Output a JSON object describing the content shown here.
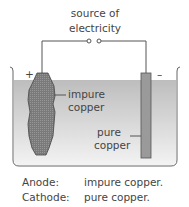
{
  "diagram": {
    "title_line1": "source of",
    "title_line2": "electricity",
    "anode_sign": "+",
    "cathode_sign": "–",
    "anode_label_line1": "impure",
    "anode_label_line2": "copper",
    "cathode_label_line1": "pure",
    "cathode_label_line2": "copper",
    "colors": {
      "electrolyte_top": "#bdbdbd",
      "electrolyte_bottom": "#f2f2f2",
      "anode_fill": "#7d7d7d",
      "cathode_fill": "#9a9a9a",
      "wire": "#555555"
    }
  },
  "legend": {
    "rows": [
      {
        "term": "Anode:",
        "value": "impure copper."
      },
      {
        "term": "Cathode:",
        "value": "pure copper."
      }
    ]
  }
}
